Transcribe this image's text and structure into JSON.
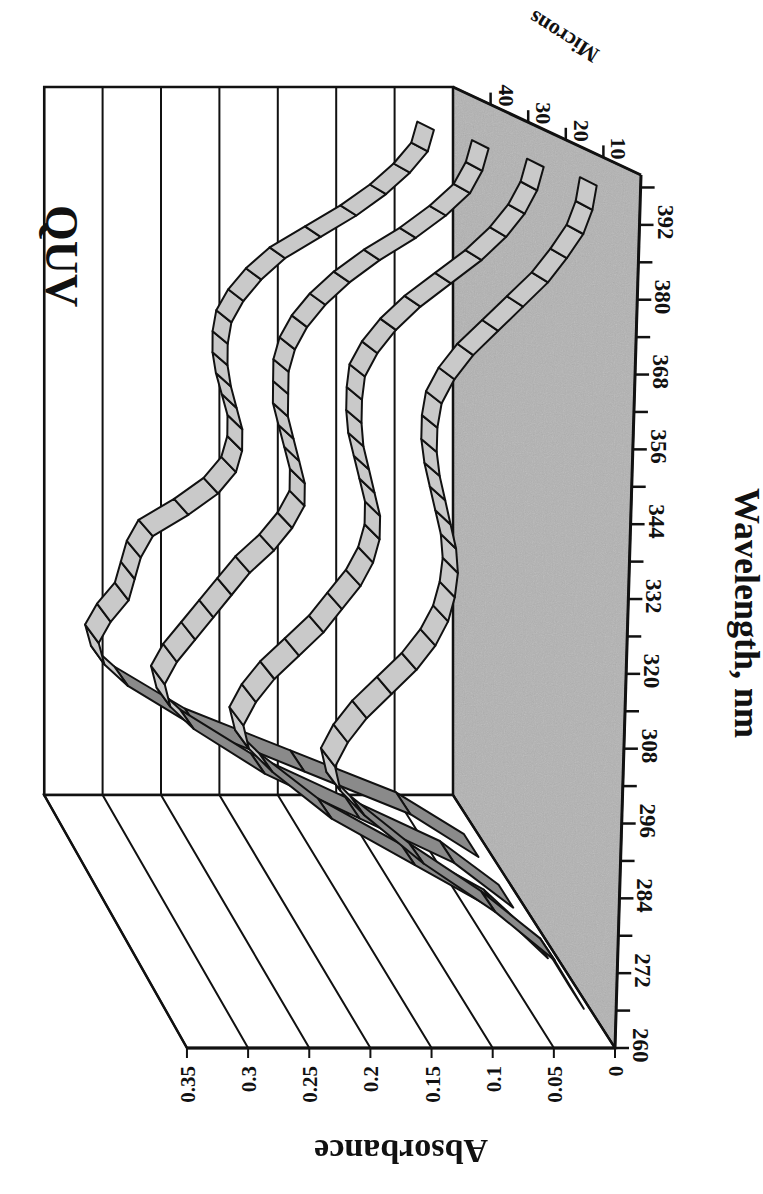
{
  "chart_data": {
    "type": "area",
    "subtype": "3d-ribbon",
    "orientation_note": "figure rotated 90 degrees clockwise on page",
    "title": "QUV",
    "xlabel": "Wavelength, nm",
    "ylabel": "Absorbance",
    "zlabel": "Microns",
    "x_ticks": [
      "260",
      "272",
      "284",
      "296",
      "308",
      "320",
      "332",
      "344",
      "356",
      "368",
      "380",
      "392"
    ],
    "x_range": [
      260,
      400
    ],
    "y_ticks": [
      "0",
      "0.05",
      "0.1",
      "0.15",
      "0.2",
      "0.25",
      "0.3",
      "0.35"
    ],
    "ylim": [
      0,
      0.35
    ],
    "z_ticks": [
      "10",
      "20",
      "30",
      "40"
    ],
    "grid": true,
    "x": [
      260,
      268,
      276,
      284,
      292,
      296,
      300,
      304,
      308,
      312,
      316,
      320,
      324,
      328,
      332,
      336,
      340,
      344,
      348,
      352,
      356,
      360,
      364,
      368,
      372,
      376,
      380,
      384,
      388,
      392,
      396
    ],
    "series": [
      {
        "name": "10",
        "values": [
          0.005,
          0.03,
          0.08,
          0.14,
          0.19,
          0.21,
          0.215,
          0.205,
          0.19,
          0.17,
          0.15,
          0.135,
          0.125,
          0.12,
          0.118,
          0.12,
          0.125,
          0.13,
          0.135,
          0.138,
          0.138,
          0.135,
          0.125,
          0.11,
          0.09,
          0.07,
          0.05,
          0.035,
          0.022,
          0.015,
          0.012
        ]
      },
      {
        "name": "20",
        "values": [
          0.008,
          0.05,
          0.12,
          0.19,
          0.24,
          0.26,
          0.265,
          0.255,
          0.24,
          0.22,
          0.2,
          0.185,
          0.17,
          0.16,
          0.155,
          0.155,
          0.16,
          0.165,
          0.17,
          0.172,
          0.172,
          0.17,
          0.16,
          0.145,
          0.125,
          0.1,
          0.075,
          0.055,
          0.04,
          0.03,
          0.025
        ]
      },
      {
        "name": "30",
        "values": [
          0.01,
          0.06,
          0.14,
          0.22,
          0.28,
          0.3,
          0.305,
          0.295,
          0.28,
          0.265,
          0.25,
          0.235,
          0.215,
          0.2,
          0.19,
          0.19,
          0.195,
          0.2,
          0.205,
          0.205,
          0.205,
          0.2,
          0.19,
          0.175,
          0.155,
          0.13,
          0.1,
          0.075,
          0.055,
          0.045,
          0.04
        ]
      },
      {
        "name": "40",
        "values": [
          0.012,
          0.07,
          0.16,
          0.25,
          0.31,
          0.33,
          0.335,
          0.325,
          0.31,
          0.305,
          0.3,
          0.29,
          0.26,
          0.235,
          0.22,
          0.215,
          0.215,
          0.22,
          0.225,
          0.228,
          0.228,
          0.225,
          0.215,
          0.2,
          0.18,
          0.15,
          0.12,
          0.095,
          0.075,
          0.06,
          0.055
        ]
      }
    ]
  },
  "labels": {
    "title": "QUV",
    "xlabel": "Wavelength, nm",
    "ylabel": "Absorbance",
    "zlabel": "Microns"
  },
  "colors": {
    "ribbon_top": "#c9c9c9",
    "ribbon_side": "#8a8a8a",
    "floor": "#b3b3b3",
    "line": "#111111",
    "background": "#ffffff"
  }
}
